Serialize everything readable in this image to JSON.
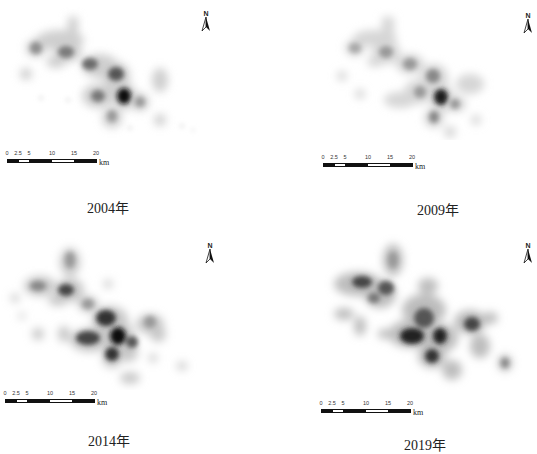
{
  "figure": {
    "panels": [
      {
        "id": "p2004",
        "caption": "2004年",
        "year": 2004,
        "density_level": "low"
      },
      {
        "id": "p2009",
        "caption": "2009年",
        "year": 2009,
        "density_level": "low-medium"
      },
      {
        "id": "p2014",
        "caption": "2014年",
        "year": 2014,
        "density_level": "medium-high"
      },
      {
        "id": "p2019",
        "caption": "2019年",
        "year": 2019,
        "density_level": "high"
      }
    ],
    "north_arrow": {
      "label": "N"
    },
    "scale_bar": {
      "ticks": [
        "0",
        "2.5",
        "5",
        "10",
        "15",
        "20"
      ],
      "unit": "km"
    },
    "colors": {
      "background": "#ffffff",
      "density_low": "#dcdcdc",
      "density_mid": "#8a8a8a",
      "density_high": "#111111"
    }
  }
}
